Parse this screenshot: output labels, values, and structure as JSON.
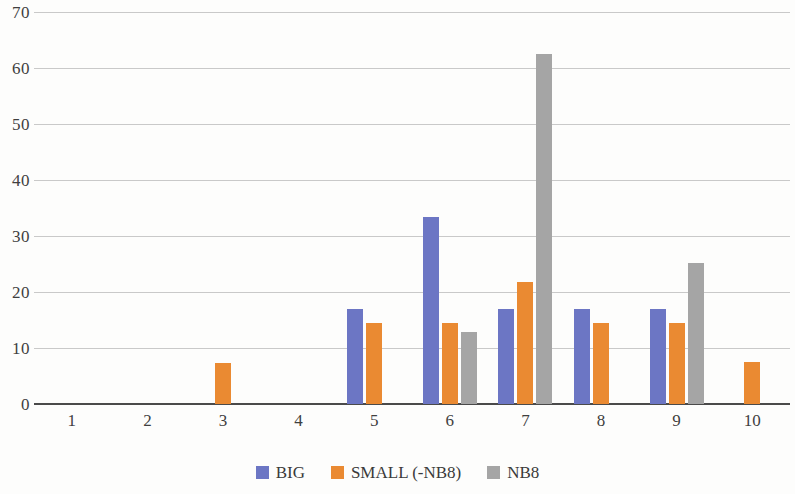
{
  "chart_data": {
    "type": "bar",
    "title": "",
    "subtitle": "",
    "xlabel": "",
    "ylabel": "",
    "categories": [
      "1",
      "2",
      "3",
      "4",
      "5",
      "6",
      "7",
      "8",
      "9",
      "10"
    ],
    "series": [
      {
        "name": "BIG",
        "color": "#6c76c4",
        "values": [
          0,
          0,
          0,
          0,
          17,
          33.4,
          17,
          17,
          17,
          0
        ]
      },
      {
        "name": "SMALL (-NB8)",
        "color": "#ea8a32",
        "values": [
          0,
          0,
          7.3,
          0,
          14.4,
          14.4,
          21.7,
          14.4,
          14.4,
          7.5
        ]
      },
      {
        "name": "NB8",
        "color": "#a5a5a5",
        "values": [
          0,
          0,
          0,
          0,
          0,
          12.9,
          62.5,
          0,
          25.2,
          0
        ]
      }
    ],
    "ylim": [
      0,
      70
    ],
    "ytick_labels": [
      "0",
      "10",
      "20",
      "30",
      "40",
      "50",
      "60",
      "70"
    ],
    "ytick_values": [
      0,
      10,
      20,
      30,
      40,
      50,
      60,
      70
    ],
    "grid": true,
    "grid_axis": "y",
    "legend_position": "bottom",
    "legend": [
      "BIG",
      "SMALL (-NB8)",
      "NB8"
    ]
  }
}
